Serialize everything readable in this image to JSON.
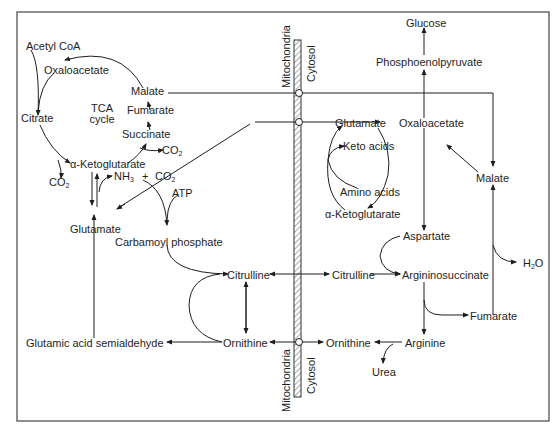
{
  "diagram": {
    "compartments": {
      "mitochondria_top": "Mitochondria",
      "cytosol_top": "Cytosol",
      "mitochondria_bottom": "Mitochondria",
      "cytosol_bottom": "Cytosol"
    },
    "tca": {
      "acetyl_coa": "Acetyl CoA",
      "oxaloacetate": "Oxaloacetate",
      "citrate": "Citrate",
      "cycle_label_1": "TCA",
      "cycle_label_2": "cycle",
      "malate": "Malate",
      "fumarate": "Fumarate",
      "succinate": "Succinate",
      "co2_succinate": "CO",
      "akg": "α-Ketoglutarate",
      "co2_akg": "CO",
      "sub2": "2"
    },
    "mito": {
      "nh3": "NH",
      "nh3_sub": "3",
      "plus": "+",
      "co2": "CO",
      "co2_sub": "2",
      "atp": "ATP",
      "glutamate": "Glutamate",
      "carbamoyl_phosphate": "Carbamoyl phosphate",
      "citrulline": "Citrulline",
      "ornithine": "Ornithine",
      "glutamic_semialdehyde": "Glutamic acid semialdehyde"
    },
    "cytosol": {
      "glucose": "Glucose",
      "pep": "Phosphoenolpyruvate",
      "glutamate": "Glutamate",
      "oxaloacetate": "Oxaloacetate",
      "keto_acids": "Keto acids",
      "amino_acids": "Amino acids",
      "akg": "α-Ketoglutarate",
      "malate": "Malate",
      "aspartate": "Aspartate",
      "citrulline": "Citrulline",
      "argininosuccinate": "Argininosuccinate",
      "fumarate": "Fumarate",
      "h2o": "H",
      "h2o_sub": "2",
      "h2o_o": "O",
      "ornithine": "Ornithine",
      "arginine": "Arginine",
      "urea": "Urea"
    },
    "colors": {
      "ink": "#1e1e1e",
      "background": "#ffffff",
      "frame": "#444444"
    }
  }
}
